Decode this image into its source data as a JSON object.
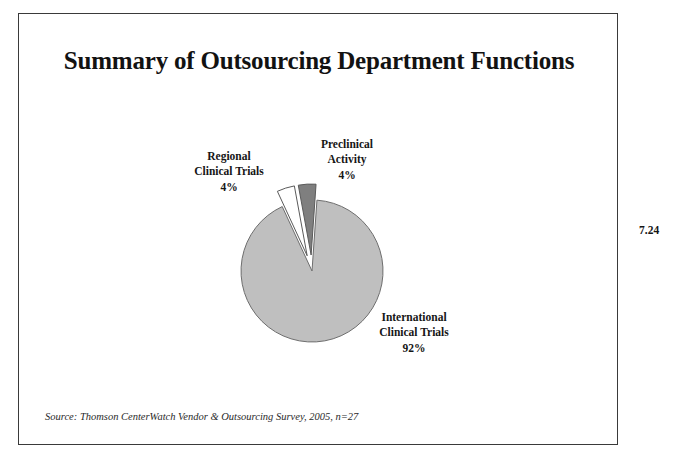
{
  "slide": {
    "title": "Summary of Outsourcing Department Functions",
    "source": "Source: Thomson CenterWatch Vendor & Outsourcing Survey, 2005, n=27",
    "page_number": "7.24",
    "border_color": "#3a3a3a",
    "background": "#ffffff"
  },
  "chart_data": {
    "type": "pie",
    "title": "Summary of Outsourcing Department Functions",
    "subtitle": "",
    "xlabel": "",
    "ylabel": "",
    "grid": false,
    "legend_position": "none",
    "labels_inline": true,
    "total": 100,
    "units": "percent",
    "sample_size": "n=27",
    "categories": [
      "International Clinical Trials",
      "Regional Clinical Trials",
      "Preclinical Activity"
    ],
    "values": [
      92,
      4,
      4
    ],
    "value_labels": [
      "92%",
      "4%",
      "4%"
    ],
    "slices": [
      {
        "name": "International Clinical Trials",
        "label_line1": "International",
        "label_line2": "Clinical Trials",
        "value": 92,
        "value_label": "92%",
        "color": "#bfbfbf",
        "stroke": "#6e6e6e",
        "exploded": false
      },
      {
        "name": "Regional Clinical Trials",
        "label_line1": "Regional",
        "label_line2": "Clinical Trials",
        "value": 4,
        "value_label": "4%",
        "color": "#ffffff",
        "stroke": "#5a5a5a",
        "exploded": true
      },
      {
        "name": "Preclinical Activity",
        "label_line1": "Preclinical",
        "label_line2": "Activity",
        "value": 4,
        "value_label": "4%",
        "color": "#7f7f7f",
        "stroke": "#5a5a5a",
        "exploded": true
      }
    ],
    "geometry": {
      "center_x": 293,
      "center_y": 257,
      "radius": 71,
      "start_angle_deg": -86,
      "explode_offset": 16,
      "direction": "clockwise"
    }
  }
}
